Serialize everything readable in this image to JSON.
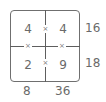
{
  "puzzle": {
    "type": "2x2 multiplication grid",
    "operator_symbol": "×",
    "cells": [
      [
        "4",
        "4"
      ],
      [
        "2",
        "9"
      ]
    ],
    "row_products": [
      "16",
      "18"
    ],
    "column_products": [
      "8",
      "36"
    ]
  },
  "colors": {
    "line": "#5e5e5e",
    "text": "#6a6a6a",
    "background": "#ffffff"
  }
}
